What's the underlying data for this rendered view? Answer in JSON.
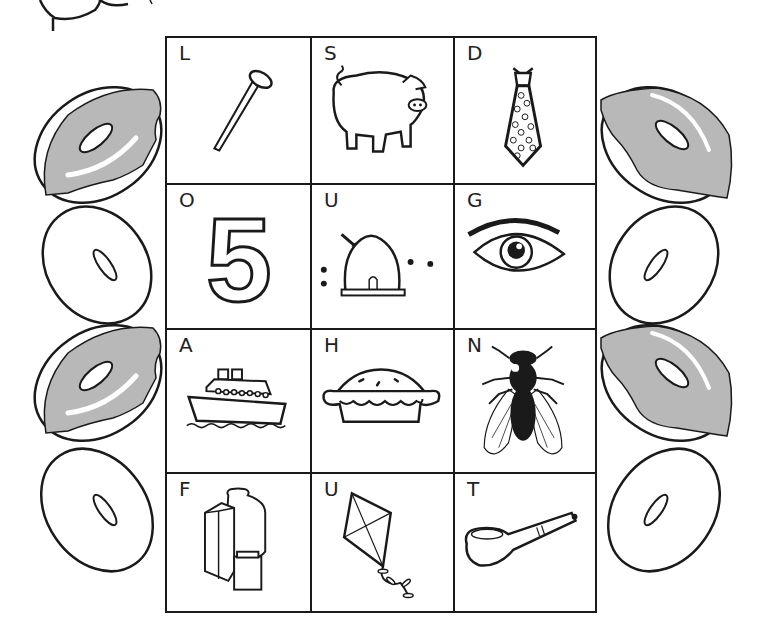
{
  "worksheet": {
    "grid": {
      "rows": 4,
      "columns": 3,
      "cells": [
        {
          "letter": "L",
          "picture": "nail"
        },
        {
          "letter": "S",
          "picture": "pig"
        },
        {
          "letter": "D",
          "picture": "tie"
        },
        {
          "letter": "O",
          "picture": "number-five"
        },
        {
          "letter": "U",
          "picture": "beehive"
        },
        {
          "letter": "G",
          "picture": "eye"
        },
        {
          "letter": "A",
          "picture": "ship"
        },
        {
          "letter": "H",
          "picture": "pie"
        },
        {
          "letter": "N",
          "picture": "fly"
        },
        {
          "letter": "F",
          "picture": "milk-cartons"
        },
        {
          "letter": "U",
          "picture": "kite"
        },
        {
          "letter": "T",
          "picture": "pipe"
        }
      ],
      "number_shown": "5"
    },
    "donuts": {
      "left": [
        "frosted",
        "plain",
        "frosted",
        "plain"
      ],
      "right": [
        "frosted",
        "plain",
        "frosted",
        "plain"
      ]
    },
    "colors": {
      "ink": "#1a1a1a",
      "frosting": "#b8b8b8",
      "paper": "#ffffff"
    }
  }
}
